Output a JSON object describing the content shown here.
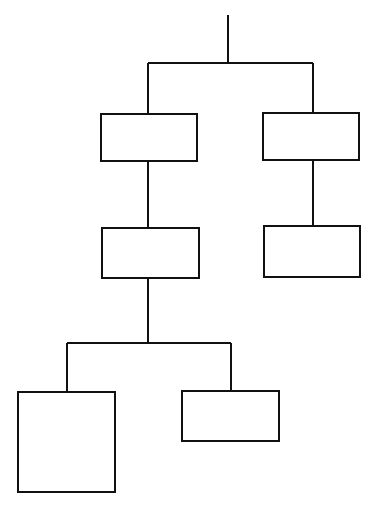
{
  "diagram": {
    "type": "tree",
    "stroke_color": "#111111",
    "background": "#ffffff",
    "nodes": [
      {
        "id": "n1",
        "label": "",
        "x": 100,
        "y": 113,
        "w": 98,
        "h": 49
      },
      {
        "id": "n2",
        "label": "",
        "x": 262,
        "y": 112,
        "w": 98,
        "h": 49
      },
      {
        "id": "n3",
        "label": "",
        "x": 101,
        "y": 227,
        "w": 99,
        "h": 52
      },
      {
        "id": "n4",
        "label": "",
        "x": 263,
        "y": 225,
        "w": 98,
        "h": 53
      },
      {
        "id": "n5",
        "label": "",
        "x": 17,
        "y": 391,
        "w": 99,
        "h": 102
      },
      {
        "id": "n6",
        "label": "",
        "x": 181,
        "y": 390,
        "w": 99,
        "h": 52
      }
    ],
    "edges": [
      {
        "from": "root",
        "to": [
          "n1",
          "n2"
        ]
      },
      {
        "from": "n1",
        "to": [
          "n3"
        ]
      },
      {
        "from": "n2",
        "to": [
          "n4"
        ]
      },
      {
        "from": "n3",
        "to": [
          "n5",
          "n6"
        ]
      }
    ]
  }
}
